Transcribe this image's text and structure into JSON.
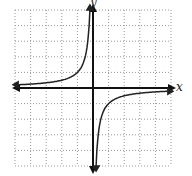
{
  "chart_data": {
    "type": "line",
    "title": "",
    "function": "y = -1/x",
    "xlabel": "x",
    "ylabel": "y",
    "xlim": [
      -5,
      5
    ],
    "ylim": [
      -5,
      5
    ],
    "grid": true,
    "grid_style": "dotted",
    "series": [
      {
        "name": "left branch",
        "x": [
          -4.9,
          -4,
          -3,
          -2,
          -1,
          -0.5,
          -0.3,
          -0.2
        ],
        "values": [
          0.2,
          0.25,
          0.33,
          0.5,
          1,
          2,
          3.33,
          5
        ]
      },
      {
        "name": "right branch",
        "x": [
          0.2,
          0.3,
          0.5,
          1,
          2,
          3,
          4,
          4.9
        ],
        "values": [
          -5,
          -3.33,
          -2,
          -1,
          -0.5,
          -0.33,
          -0.25,
          -0.2
        ]
      }
    ],
    "asymptotes": {
      "vertical": 0,
      "horizontal": 0
    }
  },
  "axes": {
    "x_label": "x",
    "y_label": "y"
  }
}
